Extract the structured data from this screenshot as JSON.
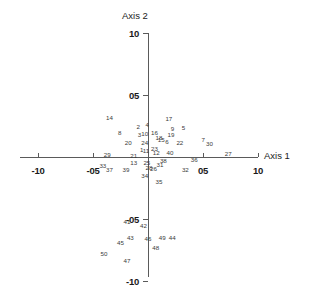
{
  "chart_data": {
    "type": "scatter",
    "title": "",
    "xlabel": "Axis 1",
    "ylabel": "Axis 2",
    "xlim": [
      -10,
      10
    ],
    "ylim": [
      -10,
      10
    ],
    "grid": false,
    "legend": "none",
    "point_marker": "label-only",
    "xticks": [
      {
        "value": -10,
        "label": "-10"
      },
      {
        "value": -5,
        "label": "-05"
      },
      {
        "value": 5,
        "label": "05"
      },
      {
        "value": 10,
        "label": "10"
      }
    ],
    "yticks": [
      {
        "value": 10,
        "label": "10"
      },
      {
        "value": 5,
        "label": "05"
      },
      {
        "value": -5,
        "label": "-05"
      },
      {
        "value": -10,
        "label": "-10"
      }
    ],
    "points": [
      {
        "label": "1",
        "x": -0.6,
        "y": 0.55
      },
      {
        "label": "2",
        "x": -0.9,
        "y": 2.45
      },
      {
        "label": "3",
        "x": -0.8,
        "y": 1.75
      },
      {
        "label": "4",
        "x": -0.1,
        "y": 2.55
      },
      {
        "label": "5",
        "x": 3.2,
        "y": 2.35
      },
      {
        "label": "6",
        "x": 1.7,
        "y": 1.25
      },
      {
        "label": "7",
        "x": 5.0,
        "y": 1.35
      },
      {
        "label": "8",
        "x": -2.6,
        "y": 1.95
      },
      {
        "label": "9",
        "x": 2.2,
        "y": 2.25
      },
      {
        "label": "10",
        "x": -0.3,
        "y": 1.85
      },
      {
        "label": "11",
        "x": -0.2,
        "y": 0.45
      },
      {
        "label": "12",
        "x": 0.75,
        "y": 0.35
      },
      {
        "label": "13",
        "x": -1.3,
        "y": -0.45
      },
      {
        "label": "14",
        "x": -3.5,
        "y": 3.15
      },
      {
        "label": "15",
        "x": 1.2,
        "y": 1.35
      },
      {
        "label": "16",
        "x": 0.6,
        "y": 1.95
      },
      {
        "label": "17",
        "x": 1.9,
        "y": 3.05
      },
      {
        "label": "18",
        "x": 1.0,
        "y": 1.55
      },
      {
        "label": "19",
        "x": 2.1,
        "y": 1.75
      },
      {
        "label": "20",
        "x": -1.8,
        "y": 1.15
      },
      {
        "label": "21",
        "x": -1.3,
        "y": 0.05
      },
      {
        "label": "22",
        "x": 2.9,
        "y": 1.15
      },
      {
        "label": "23",
        "x": 0.6,
        "y": 0.65
      },
      {
        "label": "24",
        "x": -0.3,
        "y": 1.15
      },
      {
        "label": "25",
        "x": -0.1,
        "y": -0.45
      },
      {
        "label": "26",
        "x": 0.5,
        "y": -0.95
      },
      {
        "label": "27",
        "x": 7.3,
        "y": 0.25
      },
      {
        "label": "28",
        "x": 0.1,
        "y": -0.85
      },
      {
        "label": "29",
        "x": -3.7,
        "y": 0.15
      },
      {
        "label": "30",
        "x": 5.6,
        "y": 1.05
      },
      {
        "label": "31",
        "x": 1.1,
        "y": -0.65
      },
      {
        "label": "32",
        "x": 3.4,
        "y": -1.05
      },
      {
        "label": "33",
        "x": -4.1,
        "y": -0.75
      },
      {
        "label": "34",
        "x": -0.3,
        "y": -1.55
      },
      {
        "label": "35",
        "x": 1.0,
        "y": -2.05
      },
      {
        "label": "36",
        "x": 4.2,
        "y": -0.25
      },
      {
        "label": "37",
        "x": -3.5,
        "y": -1.05
      },
      {
        "label": "38",
        "x": 1.4,
        "y": -0.35
      },
      {
        "label": "39",
        "x": -2.0,
        "y": -1.05
      },
      {
        "label": "40",
        "x": 2.0,
        "y": 0.35
      },
      {
        "label": "41",
        "x": -1.9,
        "y": -5.25
      },
      {
        "label": "42",
        "x": -0.4,
        "y": -5.55
      },
      {
        "label": "43",
        "x": -1.6,
        "y": -6.55
      },
      {
        "label": "44",
        "x": 2.2,
        "y": -6.55
      },
      {
        "label": "45",
        "x": -2.5,
        "y": -6.95
      },
      {
        "label": "46",
        "x": 0.0,
        "y": -6.65
      },
      {
        "label": "47",
        "x": -1.9,
        "y": -8.35
      },
      {
        "label": "48",
        "x": 0.7,
        "y": -7.35
      },
      {
        "label": "49",
        "x": 1.3,
        "y": -6.55
      },
      {
        "label": "50",
        "x": -4.0,
        "y": -7.85
      }
    ]
  }
}
